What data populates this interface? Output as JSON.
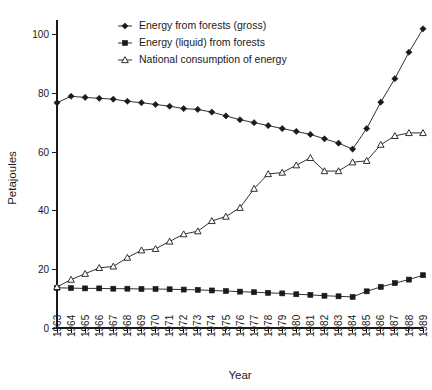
{
  "chart_data": {
    "type": "line",
    "title": "",
    "xlabel": "Year",
    "ylabel": "Petajoules",
    "xlim": [
      1963,
      1989
    ],
    "ylim": [
      0,
      105
    ],
    "yticks": [
      0,
      20,
      40,
      60,
      80,
      100
    ],
    "grid": false,
    "legend_position": "top-center",
    "x": [
      1963,
      1964,
      1965,
      1966,
      1967,
      1968,
      1969,
      1970,
      1971,
      1972,
      1973,
      1974,
      1975,
      1976,
      1977,
      1978,
      1979,
      1980,
      1981,
      1982,
      1983,
      1984,
      1985,
      1986,
      1987,
      1988,
      1989
    ],
    "categories": [
      "1963",
      "1964",
      "1965",
      "1966",
      "1967",
      "1968",
      "1969",
      "1970",
      "1971",
      "1972",
      "1973",
      "1974",
      "1975",
      "1976",
      "1977",
      "1978",
      "1979",
      "1980",
      "1981",
      "1982",
      "1983",
      "1984",
      "1985",
      "1986",
      "1987",
      "1988",
      "1989"
    ],
    "series": [
      {
        "name": "Energy from forests (gross)",
        "marker": "diamond-filled",
        "values": [
          76.8,
          79.0,
          78.6,
          78.3,
          78.0,
          77.3,
          76.8,
          76.2,
          75.6,
          74.8,
          74.5,
          73.6,
          72.3,
          71.0,
          70.0,
          69.0,
          68.0,
          67.0,
          66.0,
          64.5,
          63.0,
          61.0,
          68.0,
          77.0,
          85.0,
          94.0,
          102.0
        ]
      },
      {
        "name": "Energy (liquid) from forests",
        "marker": "square-filled",
        "values": [
          13.7,
          13.6,
          13.5,
          13.5,
          13.4,
          13.4,
          13.3,
          13.3,
          13.2,
          13.1,
          13.0,
          12.8,
          12.6,
          12.4,
          12.2,
          12.0,
          11.8,
          11.5,
          11.3,
          11.0,
          10.8,
          10.6,
          12.5,
          14.0,
          15.3,
          16.5,
          18.0
        ]
      },
      {
        "name": "National consumption of energy",
        "marker": "triangle-open",
        "values": [
          14.0,
          16.5,
          18.5,
          20.5,
          21.0,
          24.0,
          26.5,
          27.0,
          29.5,
          32.0,
          33.0,
          36.5,
          38.0,
          41.0,
          47.5,
          52.5,
          53.0,
          55.5,
          58.0,
          53.5,
          53.5,
          56.5,
          57.0,
          62.5,
          65.5,
          66.5,
          66.5
        ]
      }
    ]
  },
  "legend": {
    "items": [
      {
        "label": "Energy from forests (gross)",
        "marker": "diamond-filled"
      },
      {
        "label": "Energy (liquid) from forests",
        "marker": "square-filled"
      },
      {
        "label": "National consumption of energy",
        "marker": "triangle-open"
      }
    ]
  },
  "axes": {
    "y_title": "Petajoules",
    "x_title": "Year"
  },
  "colors": {
    "ink": "#1a1a1a",
    "background": "#ffffff"
  }
}
